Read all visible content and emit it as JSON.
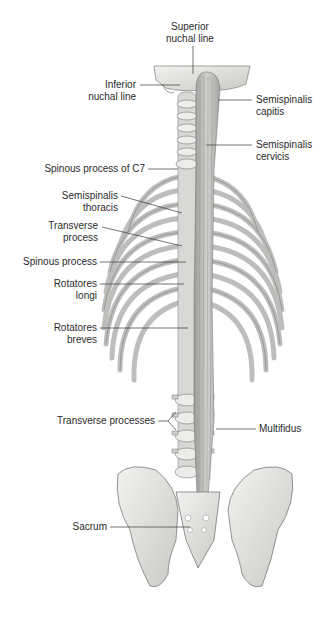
{
  "figure": {
    "labels": {
      "superior_nuchal_line": [
        "Superior",
        "nuchal line"
      ],
      "inferior_nuchal_line": [
        "Inferior",
        "nuchal line"
      ],
      "semispinalis_capitis": [
        "Semispinalis",
        "capitis"
      ],
      "semispinalis_cervicis": [
        "Semispinalis",
        "cervicis"
      ],
      "spinous_process_c7": "Spinous process of C7",
      "semispinalis_thoracis": [
        "Semispinalis",
        "thoracis"
      ],
      "transverse_process": [
        "Transverse",
        "process"
      ],
      "spinous_process": "Spinous process",
      "rotatores_longi": [
        "Rotatores",
        "longi"
      ],
      "rotatores_breves": [
        "Rotatores",
        "breves"
      ],
      "transverse_processes": "Transverse processes",
      "multifidus": "Multifidus",
      "sacrum": "Sacrum"
    },
    "colors": {
      "bone": "#e4e4e2",
      "bone_shadow": "#8a8a88",
      "muscle": "#bdbdbb",
      "leader_line": "#3a3a3a",
      "text": "#2b2b2b"
    }
  }
}
